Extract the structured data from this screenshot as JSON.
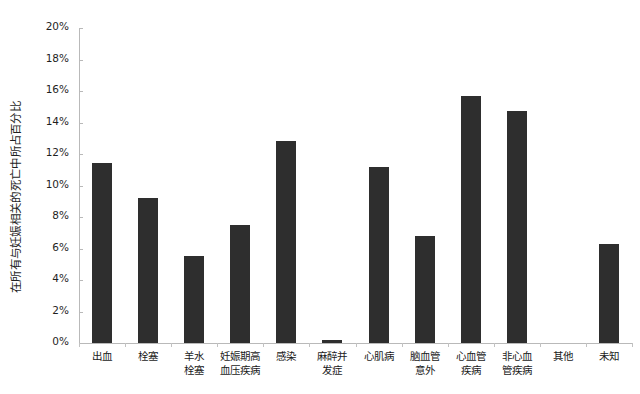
{
  "chart_data": {
    "type": "bar",
    "title": "",
    "xlabel": "",
    "ylabel": "在所有与妊娠相关的死亡中所占百分比",
    "ylim": [
      0,
      20
    ],
    "y_unit": "%",
    "y_ticks": [
      "0%",
      "2%",
      "4%",
      "6%",
      "8%",
      "10%",
      "12%",
      "14%",
      "16%",
      "18%",
      "20%"
    ],
    "y_tick_values": [
      0,
      2,
      4,
      6,
      8,
      10,
      12,
      14,
      16,
      18,
      20
    ],
    "grid": false,
    "legend": "none",
    "bar_color": "#2e2e2e",
    "axis_color": "#b9b9b9",
    "categories": [
      "出血",
      "栓塞",
      "羊水\n栓塞",
      "妊娠期高\n血压疾病",
      "感染",
      "麻醉并\n发症",
      "心肌病",
      "脑血管\n意外",
      "心血管\n疾病",
      "非心血\n管疾病",
      "其他",
      "未知"
    ],
    "values": [
      11.4,
      9.2,
      5.5,
      7.5,
      12.8,
      0.2,
      11.2,
      6.8,
      15.7,
      14.7,
      0.0,
      6.3
    ]
  }
}
